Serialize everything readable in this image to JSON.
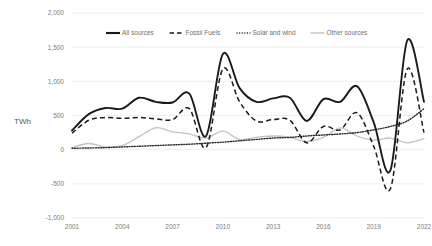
{
  "chart_data": {
    "type": "line",
    "title": "",
    "xlabel": "",
    "ylabel": "TWh",
    "ylim": [
      -1000,
      2000
    ],
    "ytick_labels": [
      "2,000",
      "1,500",
      "1,000",
      "500",
      "0",
      "-500",
      "-1,000"
    ],
    "ytick_values": [
      2000,
      1500,
      1000,
      500,
      0,
      -500,
      -1000
    ],
    "xlim": [
      2001,
      2022
    ],
    "xtick_labels": [
      "2001",
      "2004",
      "2007",
      "2010",
      "2013",
      "2016",
      "2019",
      "2022"
    ],
    "xtick_values": [
      2001,
      2004,
      2007,
      2010,
      2013,
      2016,
      2019,
      2022
    ],
    "grid": true,
    "legend_position": "top",
    "x": [
      2001,
      2002,
      2003,
      2004,
      2005,
      2006,
      2007,
      2008,
      2009,
      2010,
      2011,
      2012,
      2013,
      2014,
      2015,
      2016,
      2017,
      2018,
      2019,
      2020,
      2021,
      2022
    ],
    "series": [
      {
        "name": "All sources",
        "style": "solid-bold",
        "color": "#1a1a1a",
        "values": [
          280,
          520,
          610,
          600,
          760,
          700,
          690,
          820,
          200,
          1400,
          900,
          700,
          750,
          760,
          420,
          740,
          700,
          930,
          400,
          -300,
          1600,
          700
        ]
      },
      {
        "name": "Fossil Fuels",
        "style": "dashed",
        "color": "#1a1a1a",
        "values": [
          240,
          430,
          470,
          460,
          470,
          450,
          440,
          600,
          30,
          1180,
          700,
          420,
          440,
          430,
          100,
          340,
          290,
          540,
          50,
          -570,
          1180,
          250
        ]
      },
      {
        "name": "Solar and wind",
        "style": "dotted",
        "color": "#2b2b2b",
        "values": [
          20,
          25,
          30,
          40,
          50,
          60,
          70,
          80,
          95,
          110,
          130,
          150,
          170,
          180,
          200,
          215,
          230,
          250,
          290,
          340,
          420,
          600
        ]
      },
      {
        "name": "Other sources",
        "style": "solid-light",
        "color": "#c2c2c2",
        "values": [
          30,
          90,
          40,
          60,
          190,
          320,
          260,
          230,
          170,
          270,
          150,
          180,
          200,
          180,
          120,
          180,
          320,
          200,
          140,
          170,
          100,
          160
        ]
      }
    ]
  },
  "legend": {
    "items": [
      {
        "label": "All sources"
      },
      {
        "label": "Fossil Fuels"
      },
      {
        "label": "Solar and wind"
      },
      {
        "label": "Other sources"
      }
    ]
  }
}
